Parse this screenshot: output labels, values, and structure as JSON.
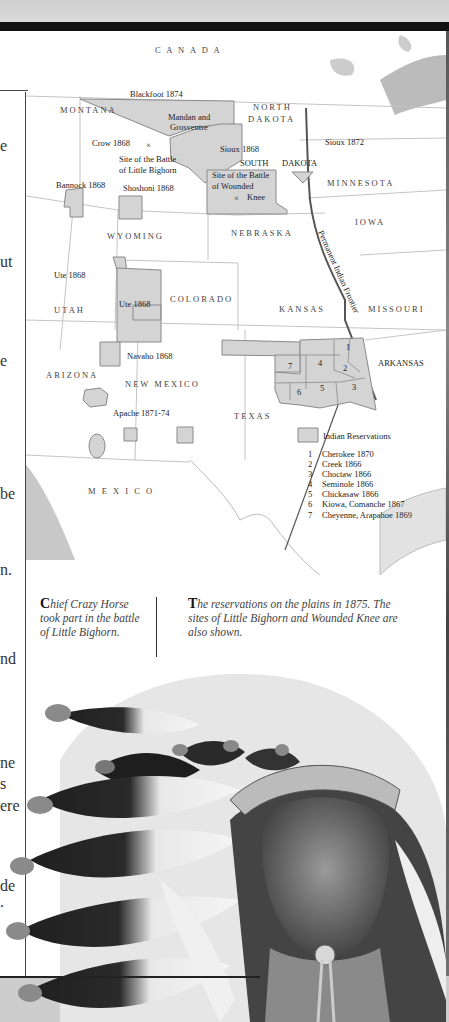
{
  "left_column_fragments": [
    "e",
    "ut",
    "e",
    "be",
    "n.",
    "nd",
    "ne",
    "s",
    "ere",
    "de",
    "."
  ],
  "map": {
    "country_labels": {
      "canada": "C A N A D A",
      "mexico": "M E X I C O"
    },
    "states": {
      "montana": "MONTANA",
      "north": "NORTH",
      "dakota_n": "DAKOTA",
      "south": "SOUTH",
      "dakota_s": "DAKOTA",
      "minnesota": "MINNESOTA",
      "iowa": "IOWA",
      "wyoming": "WYOMING",
      "nebraska": "NEBRASKA",
      "utah": "UTAH",
      "colorado": "COLORADO",
      "kansas": "KANSAS",
      "missouri": "MISSOURI",
      "arizona": "ARIZONA",
      "new_mexico": "NEW MEXICO",
      "texas": "TEXAS",
      "arkansas": "ARKANSAS"
    },
    "reservations": {
      "blackfoot": "Blackfoot 1874",
      "mandan_1": "Mandan and",
      "mandan_2": "Grosventre",
      "crow": "Crow 1868",
      "sioux_1868": "Sioux 1868",
      "sioux_1872": "Sioux 1872",
      "bannock": "Bannock 1868",
      "shoshoni": "Shoshoni 1868",
      "ute_utah": "Ute 1868",
      "ute_colorado": "Ute 1868",
      "navaho": "Navaho 1868",
      "apache": "Apache 1871-74"
    },
    "sites": {
      "little_bighorn_1": "Site of the Battle",
      "little_bighorn_2": "of Little Bighorn",
      "wounded_knee_1": "Site of the Battle",
      "wounded_knee_2": "of Wounded",
      "wounded_knee_3": "Knee",
      "marker": "×"
    },
    "frontier_label": "Permanent Indian Frontier",
    "territory_numbers": [
      "1",
      "2",
      "3",
      "4",
      "5",
      "6",
      "7"
    ],
    "legend": {
      "title": "Indian Reservations",
      "items": [
        {
          "num": "1",
          "label": "Cherokee 1870"
        },
        {
          "num": "2",
          "label": "Creek 1866"
        },
        {
          "num": "3",
          "label": "Choctaw 1866"
        },
        {
          "num": "4",
          "label": "Seminole 1866"
        },
        {
          "num": "5",
          "label": "Chickasaw 1866"
        },
        {
          "num": "6",
          "label": "Kiowa, Comanche 1867"
        },
        {
          "num": "7",
          "label": "Cheyenne, Arapahoe 1869"
        }
      ]
    },
    "colors": {
      "reservation_fill": "#d4d4d4",
      "reservation_stroke": "#8a8a8a",
      "border": "#bdbdbd",
      "frontier": "#555555"
    }
  },
  "captions": {
    "photo_dropcap": "C",
    "photo_text": "hief Crazy Horse took part in the battle of Little Bighorn.",
    "map_dropcap": "T",
    "map_text": "he reservations on the plains in 1875. The sites of Little Bighorn and Wounded Knee are also shown."
  }
}
